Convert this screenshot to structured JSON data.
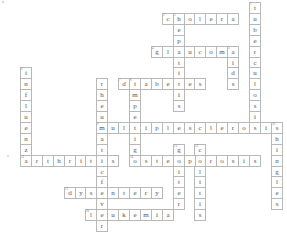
{
  "puzzle": {
    "type": "crossword",
    "grid": {
      "origin_x": 20,
      "origin_y": 2,
      "cell": 10.9
    },
    "words": [
      {
        "num": "1",
        "answer": "tuberculosis",
        "dir": "down",
        "col": 21,
        "row": 0
      },
      {
        "num": "2",
        "answer": "cholera",
        "dir": "across",
        "col": 13,
        "row": 1
      },
      {
        "num": "3",
        "answer": "hepatitis",
        "dir": "down",
        "col": 14,
        "row": 1
      },
      {
        "num": "4",
        "answer": "glaucoma",
        "dir": "across",
        "col": 12,
        "row": 4
      },
      {
        "num": "5",
        "answer": "aids",
        "dir": "down",
        "col": 19,
        "row": 4
      },
      {
        "num": "6",
        "answer": "influenza",
        "dir": "down",
        "col": 0,
        "row": 6
      },
      {
        "num": "",
        "answer": "rheumaticfever",
        "dir": "down",
        "col": 7,
        "row": 7
      },
      {
        "num": "7",
        "answer": "diabetes",
        "dir": "across",
        "col": 9,
        "row": 7
      },
      {
        "num": "8",
        "answer": "impetigo",
        "dir": "down",
        "col": 10,
        "row": 7
      },
      {
        "num": "9",
        "answer": "multiplesclerosis",
        "dir": "across",
        "col": 7,
        "row": 11
      },
      {
        "num": "10",
        "answer": "shingles",
        "dir": "down",
        "col": 23,
        "row": 11
      },
      {
        "num": "11",
        "answer": "goiter",
        "dir": "down",
        "col": 14,
        "row": 13
      },
      {
        "num": "12",
        "answer": "colitis",
        "dir": "down",
        "col": 16,
        "row": 13
      },
      {
        "num": "13",
        "answer": "arthritis",
        "dir": "across",
        "col": 0,
        "row": 14
      },
      {
        "num": "14",
        "answer": "osteoporosis",
        "dir": "across",
        "col": 10,
        "row": 14
      },
      {
        "num": "15",
        "answer": "dysentery",
        "dir": "across",
        "col": 4,
        "row": 17
      },
      {
        "num": "16",
        "answer": "leukemia",
        "dir": "across",
        "col": 6,
        "row": 19
      }
    ]
  }
}
